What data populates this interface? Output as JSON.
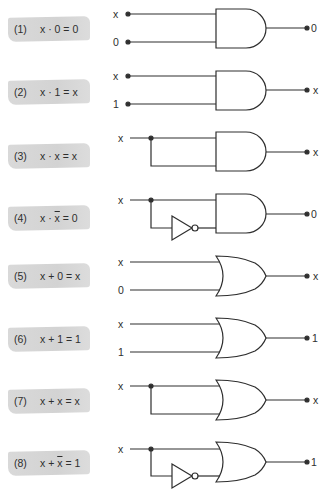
{
  "colors": {
    "ink": "#2e2e2e",
    "banner": "#d6d6d6",
    "background": "#ffffff"
  },
  "identities": [
    {
      "num": "(1)",
      "lhs": "x · 0",
      "rhs": "0",
      "expr_a": "x · ",
      "expr_bar": "",
      "expr_b": "0 = 0",
      "gate": "AND",
      "inputs": [
        "x",
        "0"
      ],
      "output": "0",
      "inverted_second": false,
      "tied": false
    },
    {
      "num": "(2)",
      "lhs": "x · 1",
      "rhs": "x",
      "expr_a": "x · ",
      "expr_bar": "",
      "expr_b": "1 = x",
      "gate": "AND",
      "inputs": [
        "x",
        "1"
      ],
      "output": "x",
      "inverted_second": false,
      "tied": false
    },
    {
      "num": "(3)",
      "lhs": "x · x",
      "rhs": "x",
      "expr_a": "x · ",
      "expr_bar": "",
      "expr_b": "x = x",
      "gate": "AND",
      "inputs": [
        "x"
      ],
      "output": "x",
      "inverted_second": false,
      "tied": true
    },
    {
      "num": "(4)",
      "lhs": "x · x̄",
      "rhs": "0",
      "expr_a": "x · ",
      "expr_bar": "x",
      "expr_b": " = 0",
      "gate": "AND",
      "inputs": [
        "x"
      ],
      "output": "0",
      "inverted_second": true,
      "tied": true
    },
    {
      "num": "(5)",
      "lhs": "x + 0",
      "rhs": "x",
      "expr_a": "x + ",
      "expr_bar": "",
      "expr_b": "0 = x",
      "gate": "OR",
      "inputs": [
        "x",
        "0"
      ],
      "output": "x",
      "inverted_second": false,
      "tied": false
    },
    {
      "num": "(6)",
      "lhs": "x + 1",
      "rhs": "1",
      "expr_a": "x + ",
      "expr_bar": "",
      "expr_b": "1 = 1",
      "gate": "OR",
      "inputs": [
        "x",
        "1"
      ],
      "output": "1",
      "inverted_second": false,
      "tied": false
    },
    {
      "num": "(7)",
      "lhs": "x + x",
      "rhs": "x",
      "expr_a": "x + ",
      "expr_bar": "",
      "expr_b": "x = x",
      "gate": "OR",
      "inputs": [
        "x"
      ],
      "output": "x",
      "inverted_second": false,
      "tied": true
    },
    {
      "num": "(8)",
      "lhs": "x + x̄",
      "rhs": "1",
      "expr_a": "x + ",
      "expr_bar": "x",
      "expr_b": " = 1",
      "gate": "OR",
      "inputs": [
        "x"
      ],
      "output": "1",
      "inverted_second": true,
      "tied": true
    }
  ]
}
